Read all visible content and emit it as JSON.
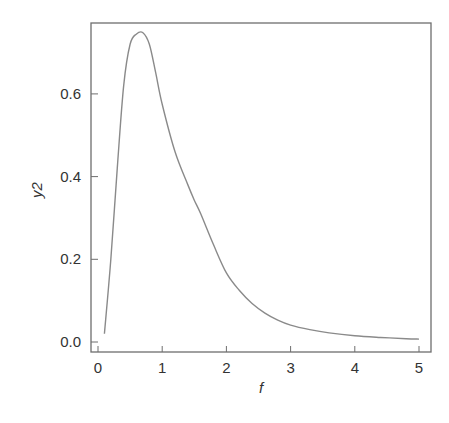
{
  "chart_data": {
    "type": "line",
    "title": "",
    "xlabel": "f",
    "ylabel": "y2",
    "xlim": [
      -0.1,
      5.2
    ],
    "ylim": [
      -0.02,
      0.76
    ],
    "grid": false,
    "legend": null,
    "x_ticks": [
      0,
      1,
      2,
      3,
      4,
      5
    ],
    "x_tick_labels": [
      "0",
      "1",
      "2",
      "3",
      "4",
      "5"
    ],
    "y_ticks": [
      0.0,
      0.2,
      0.4,
      0.6
    ],
    "y_tick_labels": [
      "0.0",
      "0.2",
      "0.4",
      "0.6"
    ],
    "series": [
      {
        "name": "y2",
        "color": "#8a8a8a",
        "x": [
          0.1,
          0.2,
          0.3,
          0.4,
          0.5,
          0.6,
          0.7,
          0.8,
          0.9,
          1.0,
          1.2,
          1.4,
          1.5,
          1.6,
          1.8,
          2.0,
          2.2,
          2.4,
          2.6,
          2.8,
          3.0,
          3.3,
          3.6,
          4.0,
          4.4,
          4.8,
          5.0
        ],
        "y": [
          0.02,
          0.2,
          0.42,
          0.62,
          0.72,
          0.745,
          0.748,
          0.72,
          0.65,
          0.575,
          0.46,
          0.38,
          0.343,
          0.31,
          0.235,
          0.167,
          0.125,
          0.093,
          0.07,
          0.053,
          0.041,
          0.03,
          0.022,
          0.015,
          0.011,
          0.008,
          0.007
        ]
      }
    ]
  },
  "plot": {
    "frame_color": "#6e6e6e",
    "line_color": "#8a8a8a",
    "text_color": "#333333"
  }
}
